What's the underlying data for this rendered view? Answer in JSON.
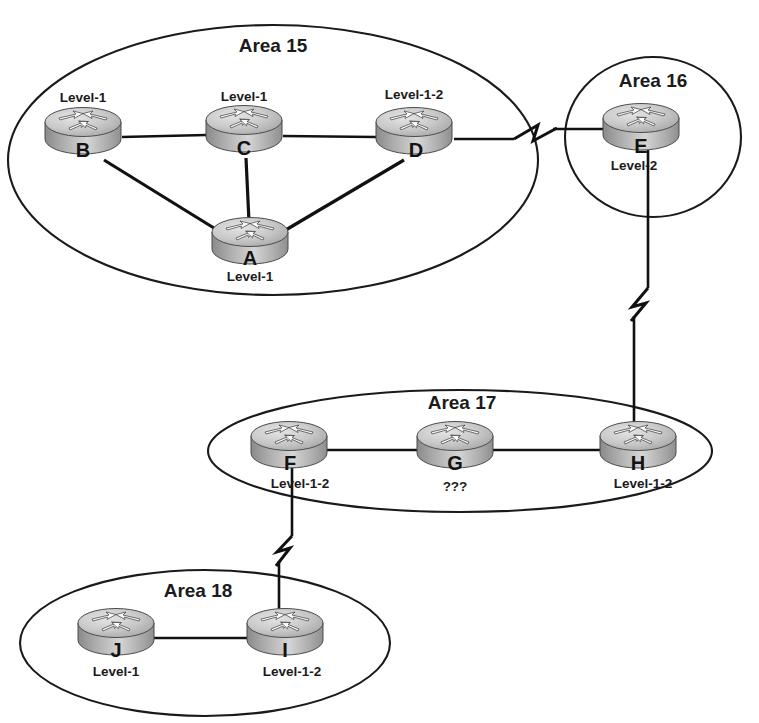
{
  "diagram": {
    "background_color": "#ffffff",
    "line_color": "#111111",
    "text_color": "#1b1b1b",
    "router_top_color": "#d8d8d8",
    "router_body_dark": "#6f6f6f",
    "router_body_light": "#e6e6e6"
  },
  "areas": [
    {
      "id": "area-15",
      "label": "Area 15",
      "shape": "ellipse",
      "cx": 273,
      "cy": 160,
      "rx": 265,
      "ry": 135,
      "label_x": 273,
      "label_y": 47
    },
    {
      "id": "area-16",
      "label": "Area 16",
      "shape": "ellipse",
      "cx": 653,
      "cy": 137,
      "rx": 88,
      "ry": 80,
      "label_x": 653,
      "label_y": 82
    },
    {
      "id": "area-17",
      "label": "Area 17",
      "shape": "ellipse",
      "cx": 460,
      "cy": 451,
      "rx": 252,
      "ry": 61,
      "label_x": 462,
      "label_y": 404
    },
    {
      "id": "area-18",
      "label": "Area 18",
      "shape": "ellipse",
      "cx": 205,
      "cy": 643,
      "rx": 185,
      "ry": 73,
      "label_x": 198,
      "label_y": 592
    }
  ],
  "routers": [
    {
      "id": "router-b",
      "letter": "B",
      "level": "Level-1",
      "cx": 83,
      "cy": 133,
      "level_pos": "above",
      "level_x": 83,
      "level_y": 98,
      "letter_x": 83,
      "letter_y": 152
    },
    {
      "id": "router-c",
      "letter": "C",
      "level": "Level-1",
      "cx": 244,
      "cy": 131,
      "level_pos": "above",
      "level_x": 244,
      "level_y": 97,
      "letter_x": 244,
      "letter_y": 150
    },
    {
      "id": "router-d",
      "letter": "D",
      "level": "Level-1-2",
      "cx": 414,
      "cy": 133,
      "level_pos": "above",
      "level_x": 414,
      "level_y": 95,
      "letter_x": 416,
      "letter_y": 152
    },
    {
      "id": "router-a",
      "letter": "A",
      "level": "Level-1",
      "cx": 250,
      "cy": 243,
      "level_pos": "below",
      "level_x": 250,
      "level_y": 277,
      "letter_x": 250,
      "letter_y": 260
    },
    {
      "id": "router-e",
      "letter": "E",
      "level": "Level-2",
      "cx": 641,
      "cy": 129,
      "level_pos": "below",
      "level_x": 634,
      "level_y": 166,
      "letter_x": 641,
      "letter_y": 148
    },
    {
      "id": "router-f",
      "letter": "F",
      "level": "Level-1-2",
      "cx": 289,
      "cy": 447,
      "level_pos": "below",
      "level_x": 300,
      "level_y": 484,
      "letter_x": 290,
      "letter_y": 465
    },
    {
      "id": "router-g",
      "letter": "G",
      "level": "???",
      "cx": 455,
      "cy": 447,
      "level_pos": "below",
      "level_x": 455,
      "level_y": 487,
      "letter_x": 455,
      "letter_y": 465
    },
    {
      "id": "router-h",
      "letter": "H",
      "level": "Level-1-2",
      "cx": 638,
      "cy": 447,
      "level_pos": "below",
      "level_x": 643,
      "level_y": 484,
      "letter_x": 638,
      "letter_y": 465
    },
    {
      "id": "router-j",
      "letter": "J",
      "level": "Level-1",
      "cx": 116,
      "cy": 634,
      "level_pos": "below",
      "level_x": 116,
      "level_y": 672,
      "letter_x": 116,
      "letter_y": 652
    },
    {
      "id": "router-i",
      "letter": "I",
      "level": "Level-1-2",
      "cx": 285,
      "cy": 634,
      "level_pos": "below",
      "level_x": 292,
      "level_y": 672,
      "letter_x": 285,
      "letter_y": 652
    }
  ],
  "links": [
    {
      "id": "link-b-c",
      "from": "B",
      "to": "C",
      "style": "straight",
      "x1": 122,
      "y1": 137,
      "x2": 206,
      "y2": 135
    },
    {
      "id": "link-c-d",
      "from": "C",
      "to": "D",
      "style": "straight",
      "x1": 283,
      "y1": 136,
      "x2": 376,
      "y2": 137
    },
    {
      "id": "link-b-a",
      "from": "B",
      "to": "A",
      "style": "straight",
      "x1": 104,
      "y1": 160,
      "x2": 220,
      "y2": 233
    },
    {
      "id": "link-c-a",
      "from": "C",
      "to": "A",
      "style": "straight",
      "x1": 246,
      "y1": 158,
      "x2": 249,
      "y2": 222
    },
    {
      "id": "link-d-a",
      "from": "D",
      "to": "A",
      "style": "straight",
      "x1": 404,
      "y1": 160,
      "x2": 286,
      "y2": 231
    },
    {
      "id": "link-d-e",
      "from": "D",
      "to": "E",
      "style": "zigzag-horizontal",
      "x1": 454,
      "y1": 139,
      "x2": 604,
      "y2": 139,
      "zig_center": 524
    },
    {
      "id": "link-e-h",
      "from": "E",
      "to": "H",
      "style": "zigzag-vertical",
      "x1": 645,
      "y1": 150,
      "x2": 645,
      "y2": 425,
      "zig_center": 295
    },
    {
      "id": "link-f-g",
      "from": "F",
      "to": "G",
      "style": "straight",
      "x1": 327,
      "y1": 450,
      "x2": 419,
      "y2": 450
    },
    {
      "id": "link-g-h",
      "from": "G",
      "to": "H",
      "style": "straight",
      "x1": 492,
      "y1": 450,
      "x2": 600,
      "y2": 450
    },
    {
      "id": "link-f-i",
      "from": "F",
      "to": "I",
      "style": "zigzag-vertical",
      "x1": 288,
      "y1": 466,
      "x2": 288,
      "y2": 618,
      "zig_center": 540
    },
    {
      "id": "link-j-i",
      "from": "J",
      "to": "I",
      "style": "straight",
      "x1": 154,
      "y1": 638,
      "x2": 248,
      "y2": 638
    }
  ]
}
